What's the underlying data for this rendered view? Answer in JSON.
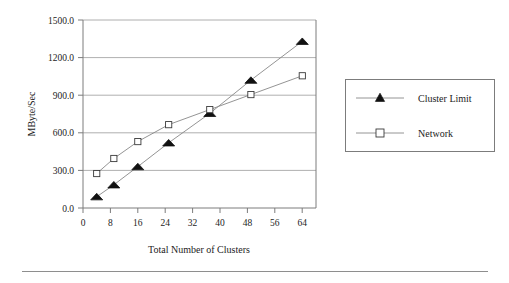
{
  "figure": {
    "background_color": "#ffffff",
    "rule_color": "#8e8e8e"
  },
  "chart_data": {
    "type": "line",
    "title": "",
    "xlabel": "Total Number of Clusters",
    "ylabel": "MByte/Sec",
    "xlim": [
      0,
      68
    ],
    "ylim": [
      0,
      1500
    ],
    "xticks": [
      0,
      8,
      16,
      24,
      32,
      40,
      48,
      56,
      64
    ],
    "xtick_labels": [
      "0",
      "8",
      "16",
      "24",
      "32",
      "40",
      "48",
      "56",
      "64"
    ],
    "yticks": [
      0,
      300,
      600,
      900,
      1200,
      1500
    ],
    "ytick_labels": [
      "0.0",
      "300.0",
      "600.0",
      "900.0",
      "1200.0",
      "1500.0"
    ],
    "grid": "horizontal",
    "legend_position": "right-outside",
    "series": [
      {
        "name": "Cluster Limit",
        "marker": "filled-triangle",
        "marker_fill": "#111111",
        "line_color": "#888888",
        "x": [
          4,
          9,
          16,
          25,
          37,
          49,
          64
        ],
        "values": [
          90,
          185,
          330,
          520,
          755,
          1020,
          1330
        ]
      },
      {
        "name": "Network",
        "marker": "open-square",
        "marker_fill": "#ffffff",
        "line_color": "#888888",
        "x": [
          4,
          9,
          16,
          25,
          37,
          49,
          64
        ],
        "values": [
          275,
          395,
          530,
          665,
          785,
          905,
          1055
        ]
      }
    ]
  },
  "legend": {
    "entries": [
      {
        "label": "Cluster Limit",
        "marker": "filled-triangle"
      },
      {
        "label": "Network",
        "marker": "open-square"
      }
    ]
  }
}
